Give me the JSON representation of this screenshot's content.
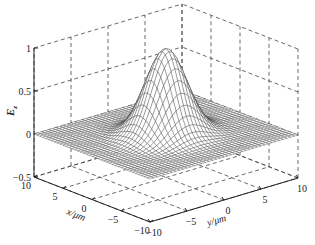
{
  "chart_data": {
    "type": "surface",
    "title": "",
    "function": "Gaussian surface E_z = exp(-(x^2 + y^2) / w^2)",
    "surface": {
      "peak_value": 1.0,
      "peak_location": {
        "x": 0,
        "y": 0
      },
      "baseline_value": 0.0,
      "width_um": 3.2,
      "grid_points_per_axis": 41
    },
    "x_axis": {
      "label": "x/μm",
      "ticks": [
        "10",
        "5",
        "0",
        "−5",
        "−10"
      ],
      "tick_values": [
        10,
        5,
        0,
        -5,
        -10
      ],
      "range": [
        -10,
        10
      ]
    },
    "y_axis": {
      "label": "y/μm",
      "ticks": [
        "−10",
        "−5",
        "0",
        "5",
        "10"
      ],
      "tick_values": [
        -10,
        -5,
        0,
        5,
        10
      ],
      "range": [
        -10,
        10
      ]
    },
    "z_axis": {
      "label_main": "E",
      "label_sub": "z",
      "ticks": [
        "1",
        "0.5",
        "0",
        "−0.5"
      ],
      "tick_values": [
        1,
        0.5,
        0,
        -0.5
      ],
      "range": [
        -0.5,
        1
      ]
    },
    "grid": true,
    "grid_style": "dashed",
    "colors": {
      "mesh": "#333333",
      "axis": "#222222",
      "grid": "#444444",
      "background": "#ffffff"
    }
  }
}
